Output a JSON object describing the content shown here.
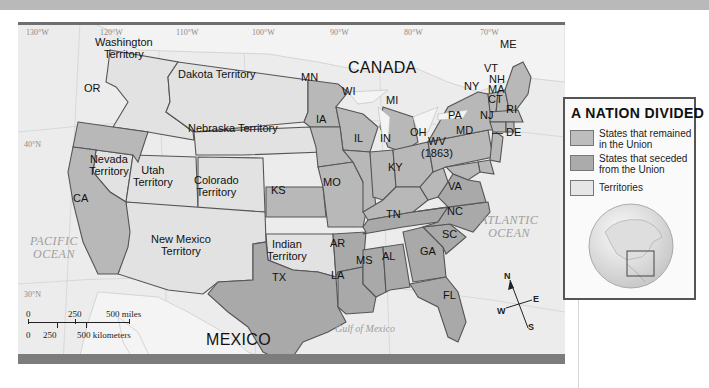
{
  "map": {
    "title": "A NATION DIVIDED",
    "colors": {
      "union": "#b8b8b8",
      "confederate": "#a8a8a8",
      "territory": "#e2e2e2",
      "ocean": "#ececec",
      "border": "#555555",
      "frame": "#7c7c7c"
    },
    "longitudes": [
      "130°W",
      "120°W",
      "110°W",
      "100°W",
      "90°W",
      "80°W",
      "70°W"
    ],
    "latitudes": [
      "40°N",
      "30°N"
    ],
    "regions": {
      "canada": "CANADA",
      "mexico": "MEXICO",
      "pacific": [
        "PACIFIC",
        "OCEAN"
      ],
      "atlantic": [
        "ATLANTIC",
        "OCEAN"
      ],
      "gulf": "Gulf of Mexico"
    },
    "territories": [
      {
        "id": "washington",
        "lines": [
          "Washington",
          "Territory"
        ]
      },
      {
        "id": "dakota",
        "lines": [
          "Dakota Territory"
        ]
      },
      {
        "id": "nebraska",
        "lines": [
          "Nebraska Territory"
        ]
      },
      {
        "id": "nevada",
        "lines": [
          "Nevada",
          "Territory"
        ]
      },
      {
        "id": "utah",
        "lines": [
          "Utah",
          "Territory"
        ]
      },
      {
        "id": "colorado",
        "lines": [
          "Colorado",
          "Territory"
        ]
      },
      {
        "id": "new-mexico",
        "lines": [
          "New Mexico",
          "Territory"
        ]
      },
      {
        "id": "indian",
        "lines": [
          "Indian",
          "Territory"
        ]
      }
    ],
    "union_states": [
      "OR",
      "CA",
      "MN",
      "WI",
      "MI",
      "IA",
      "KS",
      "MO",
      "IL",
      "IN",
      "OH",
      "KY",
      "WV",
      "PA",
      "NY",
      "NJ",
      "DE",
      "MD",
      "VT",
      "NH",
      "ME",
      "MA",
      "CT",
      "RI"
    ],
    "confederate_states": [
      "TX",
      "AR",
      "LA",
      "MS",
      "AL",
      "TN",
      "GA",
      "FL",
      "SC",
      "NC",
      "VA"
    ],
    "state_labels": {
      "OR": "OR",
      "CA": "CA",
      "MN": "MN",
      "WI": "WI",
      "MI": "MI",
      "IA": "IA",
      "KS": "KS",
      "MO": "MO",
      "IL": "IL",
      "IN": "IN",
      "OH": "OH",
      "KY": "KY",
      "WV": "WV",
      "WV_year": "(1863)",
      "PA": "PA",
      "NY": "NY",
      "NJ": "NJ",
      "DE": "DE",
      "MD": "MD",
      "VT": "VT",
      "NH": "NH",
      "ME": "ME",
      "MA": "MA",
      "CT": "CT",
      "RI": "RI",
      "TX": "TX",
      "AR": "AR",
      "LA": "LA",
      "MS": "MS",
      "AL": "AL",
      "TN": "TN",
      "GA": "GA",
      "FL": "FL",
      "SC": "SC",
      "NC": "NC",
      "VA": "VA"
    },
    "scale": {
      "miles": [
        "0",
        "250",
        "500 miles"
      ],
      "kilometers": [
        "0",
        "250",
        "500 kilometers"
      ]
    },
    "compass": {
      "n": "N",
      "s": "S",
      "e": "E",
      "w": "W"
    }
  },
  "legend": {
    "title": "A NATION DIVIDED",
    "items": [
      {
        "label": "States that remained in the Union",
        "color": "#bdbdbd"
      },
      {
        "label": "States that seceded from the Union",
        "color": "#ababab"
      },
      {
        "label": "Territories",
        "color": "#e6e6e6"
      }
    ],
    "locator": "globe-locator"
  }
}
